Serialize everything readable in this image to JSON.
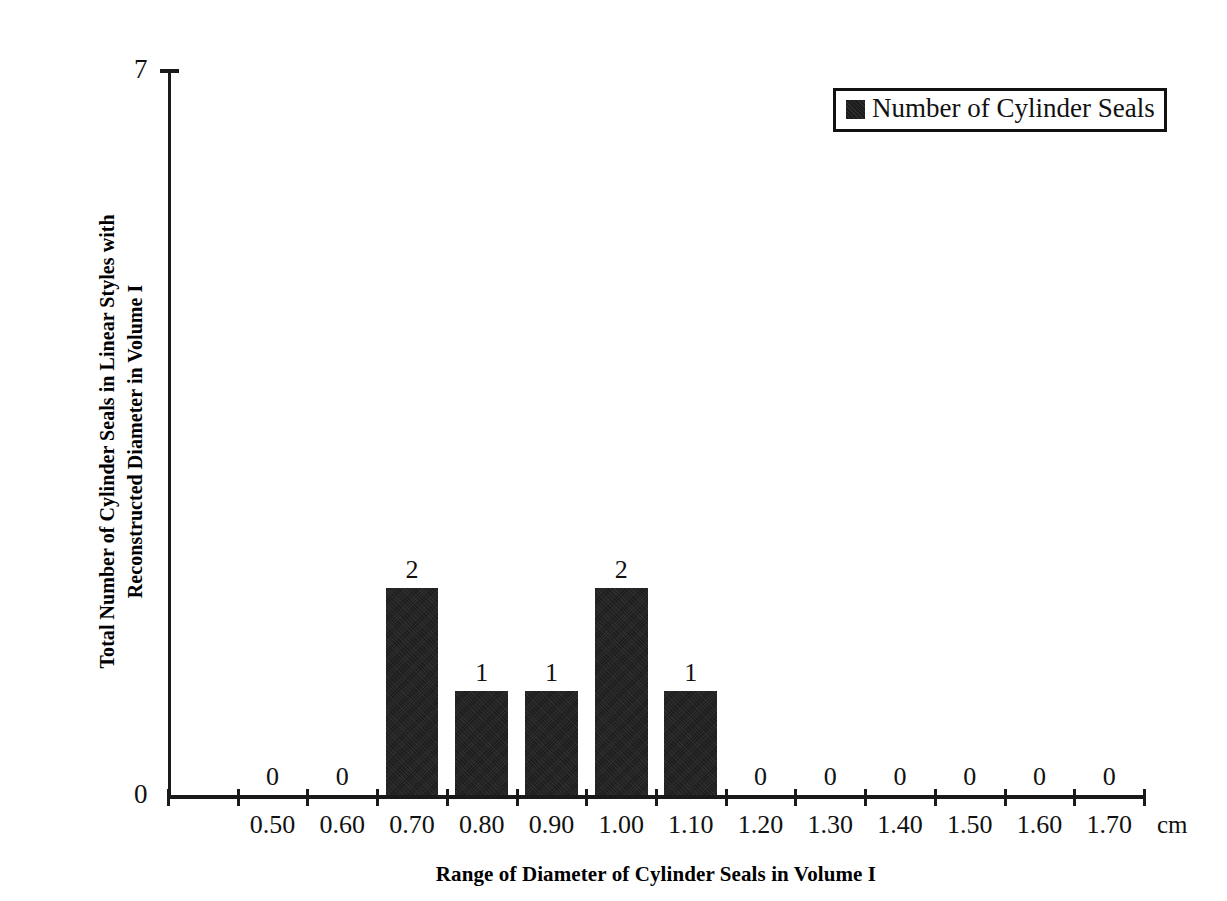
{
  "chart_data": {
    "type": "bar",
    "title": "",
    "xlabel": "Range of Diameter of Cylinder Seals in Volume I",
    "ylabel": "Total Number of Cylinder Seals in Linear Styles with Reconstructed Diameter in Volume I",
    "ylabel_line1": "Total Number of Cylinder Seals in Linear Styles with",
    "ylabel_line2": "Reconstructed Diameter in Volume I",
    "x_unit": "cm",
    "categories": [
      "0.50",
      "0.60",
      "0.70",
      "0.80",
      "0.90",
      "1.00",
      "1.10",
      "1.20",
      "1.30",
      "1.40",
      "1.50",
      "1.60",
      "1.70"
    ],
    "values": [
      0,
      0,
      2,
      1,
      1,
      2,
      1,
      0,
      0,
      0,
      0,
      0,
      0
    ],
    "data_labels": [
      "0",
      "0",
      "2",
      "1",
      "1",
      "2",
      "1",
      "0",
      "0",
      "0",
      "0",
      "0",
      "0"
    ],
    "ylim": [
      0,
      7
    ],
    "y_tick_labels": [
      "0",
      "7"
    ],
    "grid": false,
    "legend_position": "top-right",
    "legend": [
      {
        "name": "Number of Cylinder Seals",
        "color": "#1c1c1c"
      }
    ],
    "series": [
      {
        "name": "Number of Cylinder Seals",
        "values": [
          0,
          0,
          2,
          1,
          1,
          2,
          1,
          0,
          0,
          0,
          0,
          0,
          0
        ]
      }
    ]
  },
  "legend": {
    "label": "Number of Cylinder Seals",
    "swatch_icon": "filled-square-icon"
  },
  "axes": {
    "y_top_label": "7",
    "y_zero_label": "0",
    "x_title": "Range of Diameter of Cylinder Seals in Volume I",
    "y_title_line1": "Total Number of Cylinder Seals in Linear Styles with",
    "y_title_line2": "Reconstructed Diameter in Volume I",
    "unit": "cm"
  },
  "colors": {
    "bar": "#1c1c1c",
    "axis": "#1a1a1a",
    "text": "#111111",
    "background": "#ffffff"
  }
}
